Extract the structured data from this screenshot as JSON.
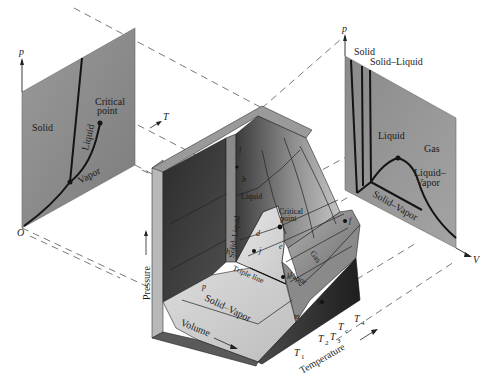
{
  "pT_projection": {
    "axis_p": "p",
    "axis_T": "T",
    "origin": "O",
    "regions": [
      "Solid",
      "Liquid",
      "Vapor"
    ],
    "critical_point": "Critical point",
    "critical_point_line1": "Critical",
    "critical_point_line2": "point"
  },
  "pV_projection": {
    "axis_p": "p",
    "axis_V": "V",
    "labels": {
      "solid": "Solid",
      "solid_liquid": "Solid–Liquid",
      "liquid": "Liquid",
      "gas": "Gas",
      "liquid_vapor_line1": "Liquid–",
      "liquid_vapor_line2": "Vapor",
      "solid_vapor": "Solid–Vapor"
    }
  },
  "pVT_surface": {
    "axis_pressure": "Pressure",
    "axis_volume": "Volume",
    "axis_temperature": "Temperature",
    "regions": {
      "solid_liquid": "Solid–Liquid",
      "liquid": "Liquid",
      "gas": "Gas",
      "vapor": "Vapor",
      "solid_vapor": "Solid–Vapor",
      "triple_line": "Triple line",
      "critical_point_line1": "Critical",
      "critical_point_line2": "point"
    },
    "points": [
      "a",
      "b",
      "c",
      "d",
      "e",
      "f",
      "g",
      "h",
      "i",
      "j",
      "k",
      "l",
      "m",
      "n",
      "p"
    ],
    "isotherms": {
      "T1": "1",
      "T2": "2",
      "T3": "3",
      "Tc": "c",
      "T4": "4",
      "T_symbol": "T"
    }
  },
  "colors": {
    "background": "#ffffff",
    "projection_plane": "#8c8c8c",
    "surface_dark": "#3a3a3a",
    "surface_mid": "#7a7a7a",
    "surface_light": "#d8d8d8",
    "curve": "#141414",
    "dashed": "#555555"
  }
}
